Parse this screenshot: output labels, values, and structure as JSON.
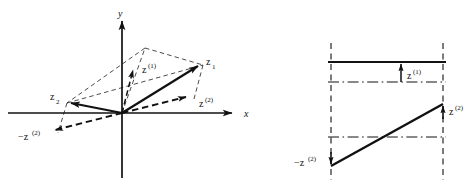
{
  "figure": {
    "type": "vector-decomposition-diagram",
    "background_color": "#ffffff",
    "line_color": "#111111",
    "panels": [
      {
        "id": "left-panel",
        "name": "vector-diagram-xy-plane",
        "axes": {
          "x_label": "x",
          "y_label": "y",
          "origin_px": [
            122,
            113
          ]
        },
        "vectors": [
          {
            "name": "z1",
            "label": "z",
            "subscript": "1",
            "superscript": "",
            "style": "solid-arrow",
            "tip_px": [
              200,
              64
            ]
          },
          {
            "name": "z2",
            "label": "z",
            "subscript": "2",
            "superscript": "",
            "style": "solid-arrow",
            "tip_px": [
              67,
              103
            ]
          },
          {
            "name": "z-sup-1",
            "label": "z",
            "subscript": "",
            "superscript": "(1)",
            "style": "dashed-arrow",
            "tip_px": [
              133,
              71
            ]
          },
          {
            "name": "z-sup-2",
            "label": "z",
            "subscript": "",
            "superscript": "(2)",
            "style": "dashed-arrow",
            "tip_px": [
              189,
              97
            ]
          },
          {
            "name": "neg-z-sup-2",
            "label": "−z",
            "subscript": "",
            "superscript": "(2)",
            "style": "dashed-arrow",
            "tip_px": [
              52,
              131
            ]
          }
        ],
        "construction_lines": "thin dashed parallelogram through apex (145,48)"
      },
      {
        "id": "right-panel",
        "name": "profile-level-diagram",
        "guides": {
          "left_vertical_px": 331,
          "right_vertical_px": 443,
          "solid_top_level_y_px": 62,
          "dashdot_upper_y_px": 82,
          "dashdot_mid_y_px": 137
        },
        "annotations": [
          {
            "name": "z-sup-1-arrow",
            "label": "z",
            "superscript": "(1)",
            "direction": "up",
            "at_px": [
              401,
              62
            ]
          },
          {
            "name": "z-sup-2-arrow",
            "label": "z",
            "superscript": "(2)",
            "direction": "up",
            "at_px": [
              443,
              104
            ]
          },
          {
            "name": "neg-z-sup-2-arrow",
            "label": "−z",
            "superscript": "(2)",
            "direction": "down",
            "at_px": [
              331,
              166
            ]
          }
        ],
        "sloped_line": {
          "from_px": [
            331,
            166
          ],
          "to_px": [
            443,
            104
          ]
        }
      }
    ],
    "labels": {
      "z1": {
        "base": "z",
        "sub": "1"
      },
      "z2": {
        "base": "z",
        "sub": "2"
      },
      "z_one": {
        "base": "z",
        "sup": "(1)"
      },
      "z_two": {
        "base": "z",
        "sup": "(2)"
      },
      "neg_z_two": {
        "base": "−z",
        "sup": "(2)"
      },
      "axis_x": "x",
      "axis_y": "y"
    }
  }
}
